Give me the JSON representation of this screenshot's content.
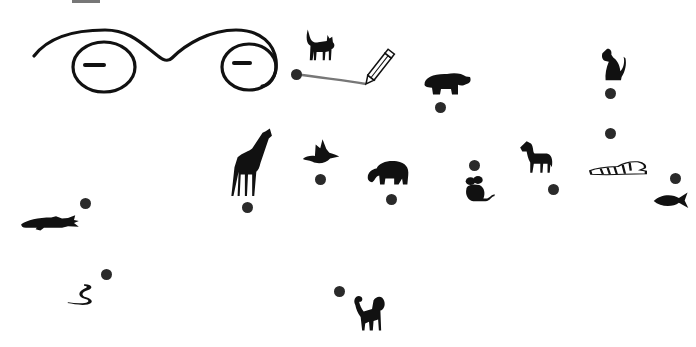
{
  "game": {
    "type": "connect-the-dots",
    "title": "Animal dot-to-dot",
    "line_color": "#777777",
    "dot_color": "#2a2a2a",
    "ink_color": "#111111"
  },
  "face": {
    "description": "Hand-drawn face: eyebrow/arch curve above two circular eyes with dash pupils"
  },
  "tool": {
    "name": "pencil",
    "position": [
      366,
      68
    ]
  },
  "drawn_line": {
    "from": [
      296,
      74
    ],
    "to": [
      366,
      84
    ]
  },
  "dots": [
    {
      "id": 1,
      "x": 296,
      "y": 74,
      "animal": "cat"
    },
    {
      "id": 2,
      "x": 440,
      "y": 107,
      "animal": "hippo"
    },
    {
      "id": 3,
      "x": 610,
      "y": 93,
      "animal": "dog"
    },
    {
      "id": 4,
      "x": 610,
      "y": 133,
      "animal": "none"
    },
    {
      "id": 5,
      "x": 675,
      "y": 178,
      "animal": "fish"
    },
    {
      "id": 6,
      "x": 553,
      "y": 189,
      "animal": "horse"
    },
    {
      "id": 7,
      "x": 474,
      "y": 165,
      "animal": "mouse"
    },
    {
      "id": 8,
      "x": 391,
      "y": 199,
      "animal": "elephant"
    },
    {
      "id": 9,
      "x": 320,
      "y": 179,
      "animal": "bird"
    },
    {
      "id": 10,
      "x": 247,
      "y": 207,
      "animal": "giraffe"
    },
    {
      "id": 11,
      "x": 85,
      "y": 203,
      "animal": "crocodile"
    },
    {
      "id": 12,
      "x": 106,
      "y": 274,
      "animal": "snake"
    },
    {
      "id": 13,
      "x": 339,
      "y": 291,
      "animal": "monkey"
    }
  ],
  "animals": [
    {
      "name": "cat",
      "x": 303,
      "y": 26,
      "w": 34,
      "h": 36
    },
    {
      "name": "hippo",
      "x": 422,
      "y": 68,
      "w": 50,
      "h": 30
    },
    {
      "name": "dog",
      "x": 596,
      "y": 46,
      "w": 32,
      "h": 36
    },
    {
      "name": "tiger",
      "x": 589,
      "y": 155,
      "w": 58,
      "h": 26
    },
    {
      "name": "fish",
      "x": 653,
      "y": 190,
      "w": 36,
      "h": 20
    },
    {
      "name": "horse",
      "x": 518,
      "y": 140,
      "w": 36,
      "h": 34
    },
    {
      "name": "mouse",
      "x": 463,
      "y": 175,
      "w": 34,
      "h": 28
    },
    {
      "name": "elephant",
      "x": 366,
      "y": 157,
      "w": 44,
      "h": 30
    },
    {
      "name": "bird",
      "x": 302,
      "y": 138,
      "w": 38,
      "h": 32
    },
    {
      "name": "giraffe",
      "x": 222,
      "y": 127,
      "w": 52,
      "h": 72
    },
    {
      "name": "crocodile",
      "x": 20,
      "y": 207,
      "w": 60,
      "h": 26
    },
    {
      "name": "snake",
      "x": 66,
      "y": 282,
      "w": 36,
      "h": 24
    },
    {
      "name": "monkey",
      "x": 350,
      "y": 293,
      "w": 38,
      "h": 40
    }
  ]
}
